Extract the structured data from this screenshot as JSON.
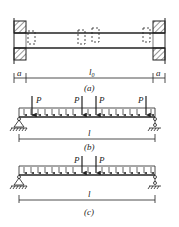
{
  "figure_a": {
    "caption": "(a)",
    "left_dim": "a",
    "span_dim": "l",
    "span_sub": "0",
    "right_dim": "a"
  },
  "figure_b": {
    "caption": "(b)",
    "span_dim": "l",
    "point_loads": [
      "P",
      "P",
      "P",
      "P"
    ]
  },
  "figure_c": {
    "caption": "(c)",
    "span_dim": "l",
    "point_loads": [
      "P",
      "P"
    ]
  },
  "colors": {
    "line": "#222222",
    "background": "#ffffff"
  }
}
